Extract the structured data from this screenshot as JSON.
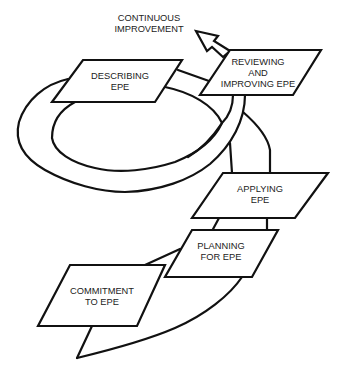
{
  "diagram": {
    "type": "cycle-flow",
    "stroke_color": "#111111",
    "background_color": "#ffffff",
    "output_label": {
      "line1": "CONTINUOUS",
      "line2": "IMPROVEMENT"
    },
    "steps": [
      {
        "id": "commitment",
        "line1": "COMMITMENT",
        "line2": "TO EPE"
      },
      {
        "id": "planning",
        "line1": "PLANNING",
        "line2": "FOR EPE"
      },
      {
        "id": "applying",
        "line1": "APPLYING",
        "line2": "EPE"
      },
      {
        "id": "reviewing",
        "line1": "REVIEWING",
        "line2": "AND",
        "line3": "IMPROVING EPE"
      },
      {
        "id": "describing",
        "line1": "DESCRIBING",
        "line2": "EPE"
      }
    ]
  }
}
